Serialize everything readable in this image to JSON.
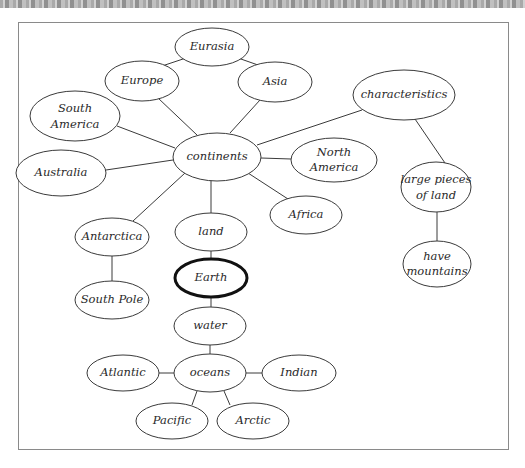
{
  "diagram": {
    "type": "concept-map",
    "center_node": "Earth",
    "colors": {
      "line": "#3a3a3a",
      "frame": "#8a8a8a",
      "background": "#ffffff",
      "text": "#2a2a2a"
    },
    "nodes": {
      "eurasia": {
        "label": "Eurasia"
      },
      "europe": {
        "label": "Europe"
      },
      "asia": {
        "label": "Asia"
      },
      "south_america": {
        "line1": "South",
        "line2": "America"
      },
      "characteristics": {
        "label": "characteristics"
      },
      "continents": {
        "label": "continents"
      },
      "australia": {
        "label": "Australia"
      },
      "north_america": {
        "line1": "North",
        "line2": "America"
      },
      "africa": {
        "label": "Africa"
      },
      "large_pieces": {
        "line1": "large pieces",
        "line2": "of land"
      },
      "antarctica": {
        "label": "Antarctica"
      },
      "land": {
        "label": "land"
      },
      "earth": {
        "label": "Earth"
      },
      "have_mountains": {
        "line1": "have",
        "line2": "mountains"
      },
      "south_pole": {
        "label": "South Pole"
      },
      "water": {
        "label": "water"
      },
      "atlantic": {
        "label": "Atlantic"
      },
      "oceans": {
        "label": "oceans"
      },
      "indian": {
        "label": "Indian"
      },
      "pacific": {
        "label": "Pacific"
      },
      "arctic": {
        "label": "Arctic"
      }
    },
    "edges": [
      [
        "Eurasia",
        "Europe"
      ],
      [
        "Eurasia",
        "Asia"
      ],
      [
        "Europe",
        "continents"
      ],
      [
        "Asia",
        "continents"
      ],
      [
        "South America",
        "continents"
      ],
      [
        "Australia",
        "continents"
      ],
      [
        "North America",
        "continents"
      ],
      [
        "Africa",
        "continents"
      ],
      [
        "Antarctica",
        "continents"
      ],
      [
        "land",
        "continents"
      ],
      [
        "characteristics",
        "continents"
      ],
      [
        "characteristics",
        "large pieces of land"
      ],
      [
        "large pieces of land",
        "have mountains"
      ],
      [
        "Antarctica",
        "South Pole"
      ],
      [
        "land",
        "Earth"
      ],
      [
        "Earth",
        "water"
      ],
      [
        "water",
        "oceans"
      ],
      [
        "oceans",
        "Atlantic"
      ],
      [
        "oceans",
        "Indian"
      ],
      [
        "oceans",
        "Pacific"
      ],
      [
        "oceans",
        "Arctic"
      ]
    ]
  }
}
